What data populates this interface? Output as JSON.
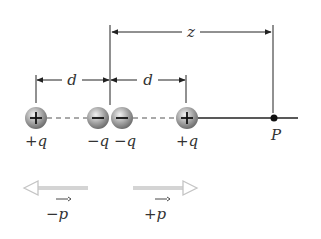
{
  "diagram": {
    "dimensions": {
      "z_label": "z",
      "d_left_label": "d",
      "d_right_label": "d"
    },
    "charges": [
      {
        "sign": "+",
        "label": "+q",
        "x": 36
      },
      {
        "sign": "−",
        "label": "−q",
        "x": 98
      },
      {
        "sign": "−",
        "label": "−q",
        "x": 122
      },
      {
        "sign": "+",
        "label": "+q",
        "x": 187
      }
    ],
    "point": {
      "label": "P",
      "x": 274
    },
    "dipole_moments": [
      {
        "label": "−p",
        "direction": "left"
      },
      {
        "label": "+p",
        "direction": "right"
      }
    ],
    "colors": {
      "line": "#222222",
      "charge_fill": "#9a9a9a",
      "arrow_outline": "#c8c8c8",
      "text": "#333333"
    }
  }
}
